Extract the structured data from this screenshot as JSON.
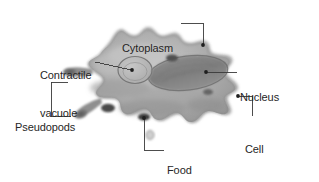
{
  "figure": {
    "background_color": "#ffffff",
    "label_color": "#262626",
    "leader_color": "#3a3a3a"
  },
  "labels": {
    "cytoplasm": {
      "line1": "Cytoplasm"
    },
    "contractile_vacuole": {
      "line1": "Contractile",
      "line2": "vacuole"
    },
    "nucleus": {
      "line1": "Nucleus"
    },
    "pseudopods": {
      "line1": "Pseudopods"
    },
    "cell_membrane": {
      "line1": "Cell",
      "line2": "membrane"
    },
    "food_vacuole": {
      "line1": "Food",
      "line2": "vacuole"
    }
  },
  "structures": [
    {
      "name": "cytoplasm",
      "kind": "region"
    },
    {
      "name": "contractile-vacuole",
      "kind": "organelle"
    },
    {
      "name": "nucleus",
      "kind": "organelle"
    },
    {
      "name": "pseudopods",
      "kind": "projection",
      "count": 2
    },
    {
      "name": "cell-membrane",
      "kind": "boundary"
    },
    {
      "name": "food-vacuole",
      "kind": "organelle"
    }
  ]
}
